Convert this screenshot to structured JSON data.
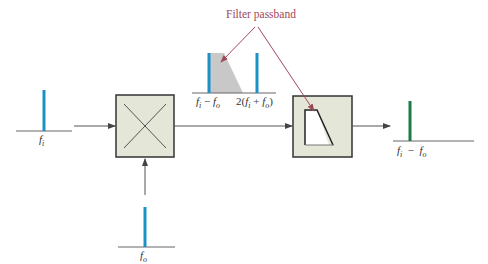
{
  "diagram": {
    "annotation": {
      "text": "Filter passband",
      "color": "#a0485a"
    },
    "colors": {
      "spectrum_line": "#1e90c8",
      "output_line": "#1a7a4a",
      "block_fill": "#e4e6d8",
      "block_border": "#333333",
      "passband_fill": "#c8c8c8",
      "arrow": "#555555"
    },
    "nodes": [
      {
        "id": "input-spectrum",
        "label_main": "f",
        "label_sub": "i"
      },
      {
        "id": "mixer",
        "symbol": "X"
      },
      {
        "id": "lo-spectrum",
        "label_main": "f",
        "label_sub": "o"
      },
      {
        "id": "mixer-output-spectrum",
        "labels": [
          "f_i − f_o",
          "2(f_i + f_o)"
        ]
      },
      {
        "id": "filter",
        "symbol": "low-pass response"
      },
      {
        "id": "output-spectrum",
        "label": "f_i − f_o"
      }
    ],
    "edges": [
      {
        "from": "input-spectrum",
        "to": "mixer"
      },
      {
        "from": "lo-spectrum",
        "to": "mixer"
      },
      {
        "from": "mixer",
        "to": "filter"
      },
      {
        "from": "filter",
        "to": "output-spectrum"
      }
    ]
  },
  "labels": {
    "fi": {
      "main": "f",
      "sub": "i"
    },
    "fo": {
      "main": "f",
      "sub": "o"
    },
    "diff": {
      "a": "f",
      "a_sub": "i",
      "op": " − ",
      "b": "f",
      "b_sub": "o"
    },
    "sum": {
      "pre": "2(",
      "a": "f",
      "a_sub": "i",
      "op": " + ",
      "b": "f",
      "b_sub": "o",
      "post": ")"
    },
    "out_diff": {
      "a": "f",
      "a_sub": "i",
      "op": "  −  ",
      "b": "f",
      "b_sub": "o"
    }
  }
}
